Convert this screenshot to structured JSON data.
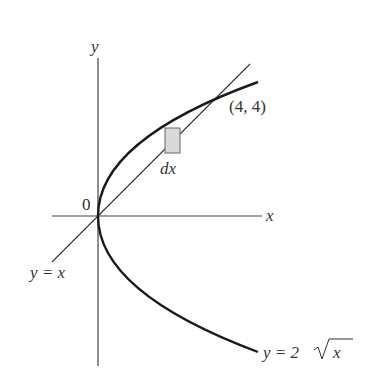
{
  "diagram": {
    "type": "region-between-curves",
    "labels": {
      "y_axis": "y",
      "x_axis": "x",
      "origin": "0",
      "intersection": "(4, 4)",
      "strip": "dx",
      "line": "y = x",
      "curve_y": "y = 2",
      "curve_radicand": "x"
    },
    "curves": [
      {
        "name": "parabola",
        "equation": "y = 2√x (x = y²/4)",
        "y_range": [
          -4,
          4.4
        ]
      },
      {
        "name": "line",
        "equation": "y = x",
        "x_range": [
          -2.2,
          4.9
        ]
      }
    ],
    "intersection_points": [
      [
        0,
        0
      ],
      [
        4,
        4
      ]
    ],
    "strip": {
      "label": "dx",
      "x_center": 2.35
    },
    "colors": {
      "curve": "#1a1a1a",
      "line": "#333333",
      "strip_fill": "#d9d9d9",
      "strip_stroke": "#666666"
    }
  }
}
